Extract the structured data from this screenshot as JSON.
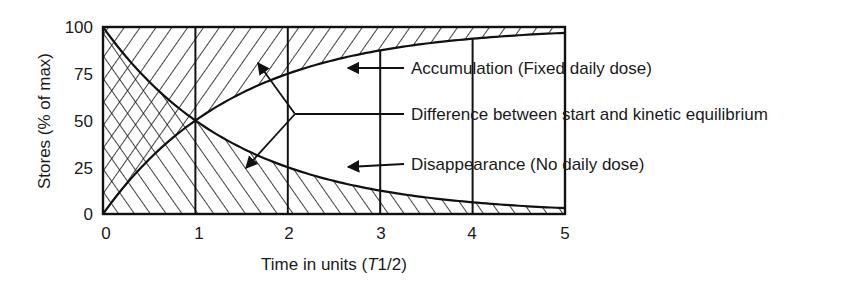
{
  "chart_data": {
    "type": "area",
    "title": "",
    "xlabel": "Time in units (T1/2)",
    "xlabel_parts": {
      "prefix": "Time in units (",
      "italic": "T",
      "suffix": "1/2)"
    },
    "ylabel": "Stores (% of max)",
    "xlim": [
      0,
      5
    ],
    "ylim": [
      0,
      100
    ],
    "x_ticks": [
      "0",
      "1",
      "2",
      "3",
      "4",
      "5"
    ],
    "y_ticks": [
      "0",
      "25",
      "50",
      "75",
      "100"
    ],
    "grid": "vertical lines at each half-life",
    "x": [
      0,
      1,
      2,
      3,
      4,
      5
    ],
    "series": [
      {
        "name": "Accumulation (Fixed daily dose)",
        "values": [
          0,
          50,
          75,
          87.5,
          93.75,
          96.875
        ],
        "hatch": "forward-slash above curve"
      },
      {
        "name": "Disappearance (No daily dose)",
        "values": [
          100,
          50,
          25,
          12.5,
          6.25,
          3.125
        ],
        "hatch": "back-slash below curve"
      }
    ],
    "annotations": [
      {
        "label": "Accumulation (Fixed daily dose)"
      },
      {
        "label": "Difference between start and kinetic equilibrium"
      },
      {
        "label": "Disappearance (No daily dose)"
      }
    ],
    "colors": {
      "line": "#111111",
      "text": "#1a1a1a",
      "background": "#ffffff"
    }
  }
}
